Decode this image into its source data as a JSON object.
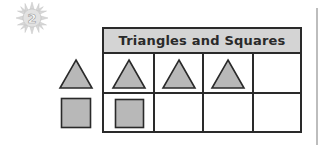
{
  "badge": {
    "number": "2",
    "icon": "sun-icon"
  },
  "table": {
    "title": "Triangles and Squares",
    "columns": 4,
    "rows": [
      {
        "shape": "triangle",
        "count": 3
      },
      {
        "shape": "square",
        "count": 1
      }
    ]
  },
  "legend": [
    {
      "shape": "triangle"
    },
    {
      "shape": "square"
    }
  ],
  "colors": {
    "shape_fill": "#b8b8b8",
    "stroke": "#2a2a2a",
    "header_bg": "#d4d4d4"
  }
}
